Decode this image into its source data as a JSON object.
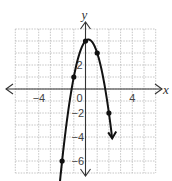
{
  "chart_data": {
    "type": "line",
    "title": "",
    "xlabel": "x",
    "ylabel": "y",
    "xlim": [
      -6,
      6
    ],
    "ylim": [
      -7,
      5
    ],
    "grid": true,
    "grid_step": 1,
    "x_tick_labels": [
      {
        "value": -4,
        "label": "−4"
      },
      {
        "value": 0,
        "label": "0"
      },
      {
        "value": 4,
        "label": "4"
      }
    ],
    "y_tick_labels": [
      {
        "value": 2,
        "label": "2"
      },
      {
        "value": -2,
        "label": "−2"
      },
      {
        "value": -4,
        "label": "−4"
      },
      {
        "value": -6,
        "label": "−6"
      }
    ],
    "series": [
      {
        "name": "parabola",
        "equation": "y = -2x^2 + x + 4",
        "arrows_on_ends": true,
        "plotted_points": [
          {
            "x": -2,
            "y": -6
          },
          {
            "x": -1,
            "y": 1
          },
          {
            "x": 0,
            "y": 4
          },
          {
            "x": 1,
            "y": 3
          },
          {
            "x": 2,
            "y": -2
          }
        ]
      }
    ],
    "axis_arrows": true
  }
}
